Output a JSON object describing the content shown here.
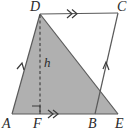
{
  "figure": {
    "type": "geometry-diagram",
    "colors": {
      "shade_fill": "#b0b0b0",
      "stroke": "#5a5a5a",
      "label": "#2a2a2a",
      "background": "#ffffff"
    },
    "vertices": [
      {
        "name": "D",
        "label": "D",
        "x": 40,
        "y": 14,
        "label_x": 30,
        "label_y": 0
      },
      {
        "name": "C",
        "label": "C",
        "x": 118,
        "y": 13,
        "label_x": 117,
        "label_y": 0
      },
      {
        "name": "A",
        "label": "A",
        "x": 12,
        "y": 114,
        "label_x": 2,
        "label_y": 117
      },
      {
        "name": "F",
        "label": "F",
        "x": 40,
        "y": 114,
        "label_x": 33,
        "label_y": 117
      },
      {
        "name": "B",
        "label": "B",
        "x": 95,
        "y": 114,
        "label_x": 88,
        "label_y": 117
      },
      {
        "name": "E",
        "label": "E",
        "x": 118,
        "y": 114,
        "label_x": 115,
        "label_y": 117
      }
    ],
    "altitude": {
      "label": "h",
      "label_x": 44,
      "label_y": 56,
      "style": "dashed",
      "from": "D",
      "to": "F"
    },
    "segments": [
      {
        "name": "DC",
        "from": "D",
        "to": "C",
        "marks": 2
      },
      {
        "name": "AE",
        "from": "A",
        "to": "E",
        "marks": 0
      },
      {
        "name": "AD",
        "from": "A",
        "to": "D",
        "marks": 1
      },
      {
        "name": "CB",
        "from": "C",
        "to": "B",
        "marks": 1
      },
      {
        "name": "DE",
        "from": "D",
        "to": "E",
        "marks": 0
      },
      {
        "name": "FB",
        "from": "F",
        "to": "B",
        "marks": 2
      }
    ],
    "right_angle": {
      "at": "F",
      "size": 8
    }
  }
}
